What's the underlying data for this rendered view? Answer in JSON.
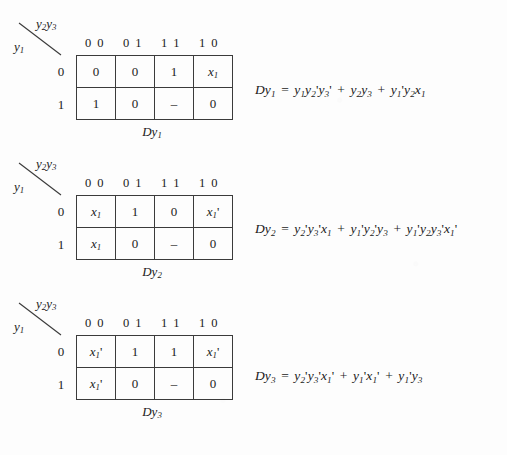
{
  "document": {
    "type": "karnaugh-map-worksheet",
    "background_color": "#fdfdfd",
    "ink_color": "#1a1a1a"
  },
  "maps": [
    {
      "id": "map1",
      "col_vars": "y2y3",
      "row_var": "y1",
      "column_headers": [
        "0 0",
        "0 1",
        "1 1",
        "1 0"
      ],
      "row_labels": [
        "0",
        "1"
      ],
      "cells": [
        [
          "0",
          "0",
          "1",
          "x1"
        ],
        [
          "1",
          "0",
          "–",
          "0"
        ]
      ],
      "caption": "Dy1"
    },
    {
      "id": "map2",
      "col_vars": "y2y3",
      "row_var": "y1",
      "column_headers": [
        "0 0",
        "0 1",
        "1 1",
        "1 0"
      ],
      "row_labels": [
        "0",
        "1"
      ],
      "cells": [
        [
          "x1",
          "1",
          "0",
          "x1'"
        ],
        [
          "x1",
          "0",
          "–",
          "0"
        ]
      ],
      "caption": "Dy2"
    },
    {
      "id": "map3",
      "col_vars": "y2y3",
      "row_var": "y1",
      "column_headers": [
        "0 0",
        "0 1",
        "1 1",
        "1 0"
      ],
      "row_labels": [
        "0",
        "1"
      ],
      "cells": [
        [
          "x1'",
          "1",
          "1",
          "x1'"
        ],
        [
          "x1'",
          "0",
          "–",
          "0"
        ]
      ],
      "caption": "Dy3"
    }
  ],
  "equations": [
    {
      "id": "eq1",
      "lhs": "Dy1",
      "rhs": "y1y2'y3' + y2y3 + y1'y2x1",
      "terms": [
        "y1y2'y3'",
        "y2y3",
        "y1'y2x1"
      ]
    },
    {
      "id": "eq2",
      "lhs": "Dy2",
      "rhs": "y2'y3'x1 + y1'y2'y3 + y1'y2y3'x1'",
      "terms": [
        "y2'y3'x1",
        "y1'y2'y3",
        "y1'y2y3'x1'"
      ]
    },
    {
      "id": "eq3",
      "lhs": "Dy3",
      "rhs": "y2'y3'x1' + y1'x1' + y1'y3",
      "terms": [
        "y2'y3'x1'",
        "y1'x1'",
        "y1'y3"
      ]
    }
  ]
}
